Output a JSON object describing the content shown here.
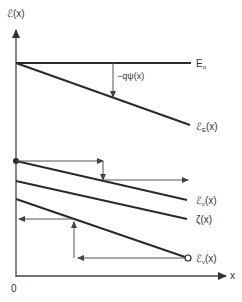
{
  "axes": {
    "y_label": "ℰ(x)",
    "x_label": "x",
    "origin_label": "0"
  },
  "curves": [
    {
      "id": "vacuum",
      "label": "E",
      "subscript": "o"
    },
    {
      "id": "electron-level",
      "label": "ℰ",
      "subscript": "E",
      "suffix": "(x)"
    },
    {
      "id": "conduction-band",
      "label": "ℰ",
      "subscript": "c",
      "suffix": "(x)"
    },
    {
      "id": "fermi-level",
      "label": "ζ(x)"
    },
    {
      "id": "valence-band",
      "label": "ℰ",
      "subscript": "v",
      "suffix": "(x)"
    }
  ],
  "annotations": {
    "potential_label": "−qψ(x)"
  },
  "colors": {
    "line": "#2a2a2a",
    "arrow": "#555555",
    "text": "#333333",
    "background": "#ffffff"
  }
}
